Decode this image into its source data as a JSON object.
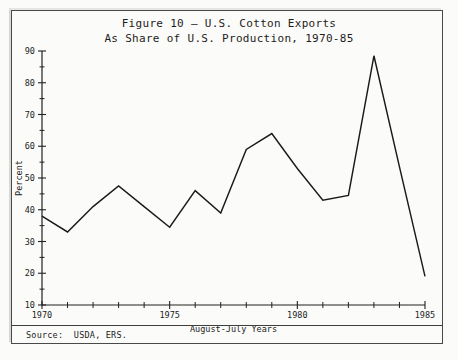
{
  "figure": {
    "title_line1": "Figure 10 — U.S. Cotton Exports",
    "title_line2": "As Share of U.S. Production, 1970-85",
    "source_label": "Source:  USDA, ERS."
  },
  "chart_data": {
    "type": "line",
    "title": "Figure 10 — U.S. Cotton Exports As Share of U.S. Production, 1970-85",
    "xlabel": "August-July Years",
    "ylabel": "Percent",
    "xlim": [
      1970,
      1985
    ],
    "ylim": [
      10,
      90
    ],
    "grid": false,
    "legend": null,
    "x_tick_labels": [
      "1970",
      "1975",
      "1980",
      "1985"
    ],
    "x_tick_values": [
      1970,
      1975,
      1980,
      1985
    ],
    "x_minor_tick_values": [
      1971,
      1972,
      1973,
      1974,
      1976,
      1977,
      1978,
      1979,
      1981,
      1982,
      1983,
      1984
    ],
    "y_tick_labels": [
      "10",
      "20",
      "30",
      "40",
      "50",
      "60",
      "70",
      "80",
      "90"
    ],
    "y_tick_values": [
      10,
      20,
      30,
      40,
      50,
      60,
      70,
      80,
      90
    ],
    "y_minor_tick_values": [
      15,
      25,
      35,
      45,
      55,
      65,
      75,
      85
    ],
    "x": [
      1970,
      1971,
      1972,
      1973,
      1974,
      1975,
      1976,
      1977,
      1978,
      1979,
      1980,
      1981,
      1982,
      1983,
      1984,
      1985
    ],
    "values": [
      38,
      33,
      41,
      47.5,
      41,
      34.5,
      46,
      39,
      59,
      64,
      53,
      43,
      44.5,
      88.5,
      53.5,
      19
    ],
    "series": [
      {
        "name": "U.S. cotton exports as share of U.S. production",
        "values": [
          38,
          33,
          41,
          47.5,
          41,
          34.5,
          46,
          39,
          59,
          64,
          53,
          43,
          44.5,
          88.5,
          53.5,
          19
        ]
      }
    ],
    "line_color": "#1a1a1a"
  }
}
